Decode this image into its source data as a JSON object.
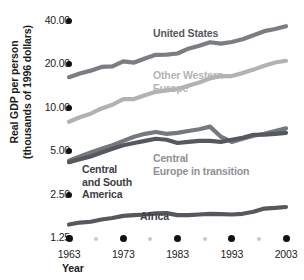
{
  "chart_data": {
    "type": "line",
    "title": "",
    "xlabel": "Year",
    "ylabel_line1": "Real GDP per person",
    "ylabel_line2": "(thousands of 1996 dollars)",
    "xlim": [
      1963,
      2003
    ],
    "ylim": [
      1.25,
      40.0
    ],
    "yscale": "log",
    "grid": false,
    "legend_position": "inline-labels",
    "xticks": [
      "1963",
      "1973",
      "1983",
      "1993",
      "2003"
    ],
    "xtick_values": [
      1963,
      1973,
      1983,
      1993,
      2003
    ],
    "xtick_minor_values": [
      1968,
      1978,
      1988,
      1998
    ],
    "yticks": [
      "1.25",
      "2.50",
      "5.00",
      "10.00",
      "20.00",
      "40.00"
    ],
    "ytick_values": [
      1.25,
      2.5,
      5.0,
      10.0,
      20.0,
      40.0
    ],
    "series": [
      {
        "name": "United States",
        "color": "#7a7d82",
        "x": [
          1963,
          1965,
          1967,
          1969,
          1971,
          1973,
          1975,
          1977,
          1979,
          1981,
          1983,
          1985,
          1987,
          1989,
          1991,
          1993,
          1995,
          1997,
          1999,
          2001,
          2003
        ],
        "values": [
          16.3,
          17.3,
          18.1,
          19.2,
          19.4,
          21.0,
          20.6,
          22.0,
          23.3,
          23.4,
          23.8,
          25.7,
          26.9,
          28.5,
          27.9,
          28.6,
          29.9,
          31.9,
          34.0,
          35.2,
          36.8
        ]
      },
      {
        "name": "Other Western Europe",
        "color": "#b0b3b6",
        "x": [
          1963,
          1965,
          1967,
          1969,
          1971,
          1973,
          1975,
          1977,
          1979,
          1981,
          1983,
          1985,
          1987,
          1989,
          1991,
          1993,
          1995,
          1997,
          1999,
          2001,
          2003
        ],
        "values": [
          8.0,
          8.6,
          9.1,
          9.9,
          10.5,
          11.5,
          11.5,
          12.2,
          12.9,
          13.2,
          13.5,
          14.2,
          15.0,
          16.0,
          16.6,
          16.6,
          17.4,
          18.4,
          19.6,
          20.6,
          21.2
        ]
      },
      {
        "name": "Central Europe in transition",
        "color": "#75787d",
        "x": [
          1963,
          1965,
          1967,
          1969,
          1971,
          1973,
          1975,
          1977,
          1979,
          1981,
          1983,
          1985,
          1987,
          1989,
          1991,
          1993,
          1995,
          1997,
          1999,
          2001,
          2003
        ],
        "values": [
          4.3,
          4.6,
          4.9,
          5.2,
          5.5,
          5.9,
          6.3,
          6.6,
          6.8,
          6.6,
          6.7,
          6.9,
          7.1,
          7.4,
          6.3,
          5.8,
          6.1,
          6.4,
          6.6,
          6.9,
          7.2
        ]
      },
      {
        "name": "Central and South America",
        "color": "#55585d",
        "x": [
          1963,
          1965,
          1967,
          1969,
          1971,
          1973,
          1975,
          1977,
          1979,
          1981,
          1983,
          1985,
          1987,
          1989,
          1991,
          1993,
          1995,
          1997,
          1999,
          2001,
          2003
        ],
        "values": [
          4.2,
          4.4,
          4.6,
          4.9,
          5.2,
          5.5,
          5.7,
          5.9,
          6.1,
          6.0,
          5.7,
          5.8,
          5.9,
          5.9,
          5.8,
          6.0,
          6.2,
          6.5,
          6.5,
          6.6,
          6.7
        ]
      },
      {
        "name": "Africa",
        "color": "#55585d",
        "x": [
          1963,
          1965,
          1967,
          1969,
          1971,
          1973,
          1975,
          1977,
          1979,
          1981,
          1983,
          1985,
          1987,
          1989,
          1991,
          1993,
          1995,
          1997,
          1999,
          2001,
          2003
        ],
        "values": [
          1.55,
          1.6,
          1.62,
          1.68,
          1.72,
          1.78,
          1.8,
          1.82,
          1.85,
          1.86,
          1.8,
          1.8,
          1.82,
          1.84,
          1.83,
          1.82,
          1.84,
          1.9,
          2.0,
          2.02,
          2.05
        ]
      }
    ],
    "annotations": [
      {
        "name": "united-states",
        "text": "United States"
      },
      {
        "name": "other-western-europe",
        "text": "Other Western\nEurope"
      },
      {
        "name": "central-south-america",
        "text": "Central\nand South\nAmerica"
      },
      {
        "name": "central-europe-in-transition",
        "text": "Central\nEurope in transition"
      },
      {
        "name": "africa",
        "text": "Africa"
      }
    ]
  }
}
